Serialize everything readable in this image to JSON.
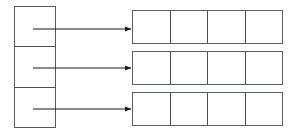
{
  "diagram": {
    "type": "block-mapping-diagram",
    "background_color": "#ffffff",
    "stroke_color": "#555a5e",
    "arrow_color": "#1a1a1a",
    "canvas": {
      "width": 299,
      "height": 134
    },
    "left_column": {
      "label": "",
      "x": 14,
      "y": 6,
      "width": 42,
      "height": 122,
      "cells": [
        {
          "label": ""
        },
        {
          "label": ""
        },
        {
          "label": ""
        }
      ]
    },
    "right_rows": [
      {
        "label": "",
        "x": 132,
        "y": 10,
        "width": 151,
        "height": 34,
        "cells": [
          {
            "label": ""
          },
          {
            "label": ""
          },
          {
            "label": ""
          },
          {
            "label": ""
          }
        ]
      },
      {
        "label": "",
        "x": 132,
        "y": 51,
        "width": 151,
        "height": 34,
        "cells": [
          {
            "label": ""
          },
          {
            "label": ""
          },
          {
            "label": ""
          },
          {
            "label": ""
          }
        ]
      },
      {
        "label": "",
        "x": 132,
        "y": 92,
        "width": 151,
        "height": 34,
        "cells": [
          {
            "label": ""
          },
          {
            "label": ""
          },
          {
            "label": ""
          },
          {
            "label": ""
          }
        ]
      }
    ],
    "arrows": [
      {
        "label": "",
        "x1": 33,
        "y1": 29,
        "x2": 131,
        "y2": 29
      },
      {
        "label": "",
        "x1": 33,
        "y1": 68,
        "x2": 131,
        "y2": 68
      },
      {
        "label": "",
        "x1": 33,
        "y1": 109,
        "x2": 131,
        "y2": 109
      }
    ]
  }
}
